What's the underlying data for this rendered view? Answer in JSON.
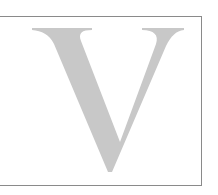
{
  "figure": {
    "letter": "V",
    "letter_color": "#c8c8c8",
    "border_color": "#8a8a8a",
    "background_color": "#ffffff"
  }
}
